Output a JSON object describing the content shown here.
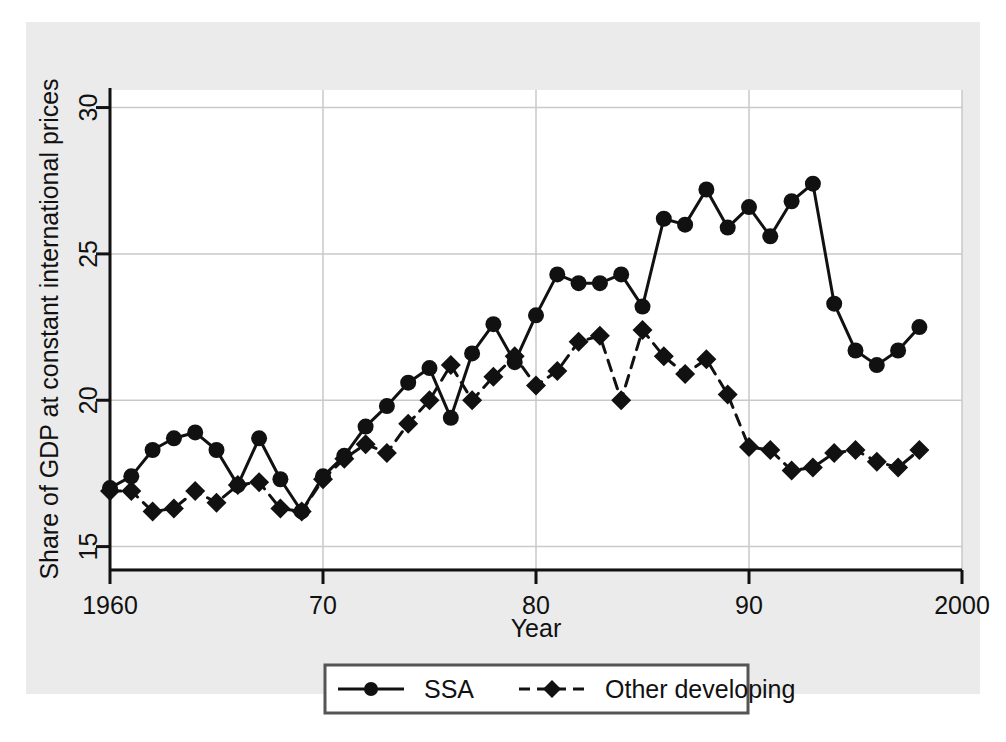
{
  "figure": {
    "background_color": "#ebebeb",
    "plot_background_color": "#ffffff",
    "ink_color": "#111111",
    "grid_color": "#c9c9c9"
  },
  "chart_data": {
    "type": "line",
    "title": "",
    "subtitle": "",
    "xlabel": "Year",
    "ylabel": "Share of GDP at constant international prices",
    "xlim": [
      1960,
      2000
    ],
    "ylim": [
      14.2,
      30.6
    ],
    "xticks": [
      1960,
      1970,
      1980,
      1990,
      2000
    ],
    "xticklabels": [
      "1960",
      "70",
      "80",
      "90",
      "2000"
    ],
    "yticks": [
      15,
      20,
      25,
      30
    ],
    "yticklabels": [
      "15",
      "20",
      "25",
      "30"
    ],
    "grid": "both",
    "legend_position": "bottom-center",
    "x": [
      1960,
      1961,
      1962,
      1963,
      1964,
      1965,
      1966,
      1967,
      1968,
      1969,
      1970,
      1971,
      1972,
      1973,
      1974,
      1975,
      1976,
      1977,
      1978,
      1979,
      1980,
      1981,
      1982,
      1983,
      1984,
      1985,
      1986,
      1987,
      1988,
      1989,
      1990,
      1991,
      1992,
      1993,
      1994,
      1995,
      1996,
      1997,
      1998
    ],
    "series": [
      {
        "name": "SSA",
        "marker": "circle",
        "linestyle": "solid",
        "color": "#111111",
        "values": [
          17.0,
          17.4,
          18.3,
          18.7,
          18.9,
          18.3,
          17.1,
          18.7,
          17.3,
          16.2,
          17.4,
          18.1,
          19.1,
          19.8,
          20.6,
          21.1,
          19.4,
          21.6,
          22.6,
          21.3,
          22.9,
          24.3,
          24.0,
          24.0,
          24.3,
          23.2,
          26.2,
          26.0,
          27.2,
          25.9,
          26.6,
          25.6,
          26.8,
          27.4,
          23.3,
          21.7,
          21.2,
          21.7,
          22.5
        ]
      },
      {
        "name": "Other developing",
        "marker": "diamond",
        "linestyle": "dashed",
        "color": "#111111",
        "values": [
          16.9,
          16.9,
          16.2,
          16.3,
          16.9,
          16.5,
          17.1,
          17.2,
          16.3,
          16.2,
          17.3,
          18.0,
          18.5,
          18.2,
          19.2,
          20.0,
          21.2,
          20.0,
          20.8,
          21.5,
          20.5,
          21.0,
          22.0,
          22.2,
          20.0,
          22.4,
          21.5,
          20.9,
          21.4,
          20.2,
          18.4,
          18.3,
          17.6,
          17.7,
          18.2,
          18.3,
          17.9,
          17.7,
          18.3
        ]
      }
    ],
    "legend": [
      {
        "label": "SSA",
        "marker": "circle",
        "linestyle": "solid"
      },
      {
        "label": "Other developing",
        "marker": "diamond",
        "linestyle": "dashed"
      }
    ]
  }
}
